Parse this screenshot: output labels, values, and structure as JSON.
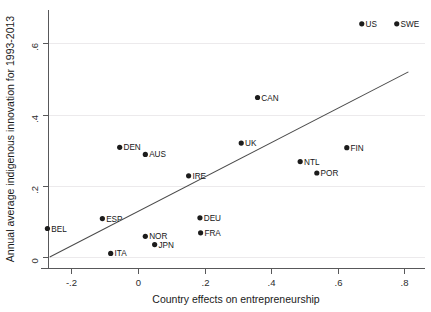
{
  "chart_data": {
    "type": "scatter",
    "title": "",
    "xlabel": "Country effects on entrepreneurship",
    "ylabel": "Annual average indigenous innovation for 1993-2013",
    "xlim": [
      -0.3,
      0.84
    ],
    "ylim": [
      -0.02,
      0.69
    ],
    "xticks": [
      -0.2,
      0,
      0.2,
      0.4,
      0.6,
      0.8
    ],
    "xticklabels": [
      "-.2",
      "0",
      ".2",
      ".4",
      ".6",
      ".8"
    ],
    "yticks": [
      0,
      0.2,
      0.4,
      0.6
    ],
    "yticklabels": [
      "0",
      ".2",
      ".4",
      ".6"
    ],
    "grid": "horizontal",
    "legend": "none",
    "points": [
      {
        "label": "US",
        "x": 0.672,
        "y": 0.655,
        "label_pos": "right"
      },
      {
        "label": "SWE",
        "x": 0.777,
        "y": 0.655,
        "label_pos": "right"
      },
      {
        "label": "CAN",
        "x": 0.359,
        "y": 0.448,
        "label_pos": "right"
      },
      {
        "label": "UK",
        "x": 0.31,
        "y": 0.32,
        "label_pos": "right"
      },
      {
        "label": "FIN",
        "x": 0.627,
        "y": 0.307,
        "label_pos": "right"
      },
      {
        "label": "DEN",
        "x": -0.055,
        "y": 0.308,
        "label_pos": "right"
      },
      {
        "label": "AUS",
        "x": 0.022,
        "y": 0.288,
        "label_pos": "right"
      },
      {
        "label": "NTL",
        "x": 0.487,
        "y": 0.268,
        "label_pos": "right"
      },
      {
        "label": "POR",
        "x": 0.537,
        "y": 0.236,
        "label_pos": "right"
      },
      {
        "label": "IRE",
        "x": 0.152,
        "y": 0.228,
        "label_pos": "right"
      },
      {
        "label": "ESP",
        "x": -0.107,
        "y": 0.108,
        "label_pos": "right"
      },
      {
        "label": "DEU",
        "x": 0.186,
        "y": 0.11,
        "label_pos": "right"
      },
      {
        "label": "BEL",
        "x": -0.272,
        "y": 0.08,
        "label_pos": "right"
      },
      {
        "label": "FRA",
        "x": 0.188,
        "y": 0.068,
        "label_pos": "right"
      },
      {
        "label": "NOR",
        "x": 0.022,
        "y": 0.058,
        "label_pos": "right"
      },
      {
        "label": "JPN",
        "x": 0.05,
        "y": 0.035,
        "label_pos": "right"
      },
      {
        "label": "ITA",
        "x": -0.082,
        "y": 0.01,
        "label_pos": "right"
      }
    ],
    "fit_line": {
      "name": "linear fit",
      "x_start": -0.265,
      "y_start": 0.0,
      "x_end": 0.812,
      "y_end": 0.52
    }
  }
}
